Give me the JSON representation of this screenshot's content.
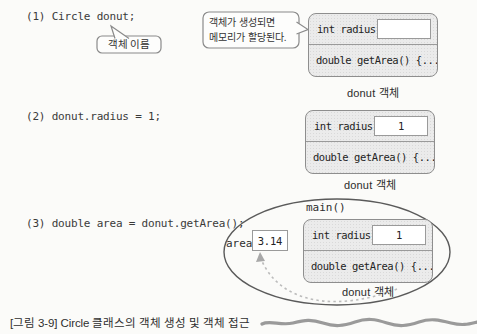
{
  "figure": {
    "caption": "[그림 3-9] Circle 클래스의 객체 생성 및 객체 접근"
  },
  "colors": {
    "box_fill": "#ebebeb",
    "box_border": "#8e8e8e",
    "code_text": "#3a3a3a",
    "ellipse_stroke": "#5a5a5a",
    "arrow": "#bcbcbc"
  },
  "step1": {
    "code": "(1) Circle donut;",
    "callout_label": "객체 이름",
    "bubble_line1": "객체가 생성되면",
    "bubble_line2": "메모리가 할당된다.",
    "box": {
      "field": "int radius",
      "field_value": "",
      "method": "double getArea() {...}",
      "caption": "donut 객체"
    }
  },
  "step2": {
    "code": "(2) donut.radius = 1;",
    "box": {
      "field": "int radius",
      "field_value": "1",
      "method": "double getArea() {...}",
      "caption": "donut 객체"
    }
  },
  "step3": {
    "code": "(3) double area = donut.getArea();",
    "scope_label": "main()",
    "area_label": "area",
    "area_value": "3.14",
    "box": {
      "field": "int radius",
      "field_value": "1",
      "method": "double getArea() {...}",
      "caption": "donut 객체"
    }
  }
}
